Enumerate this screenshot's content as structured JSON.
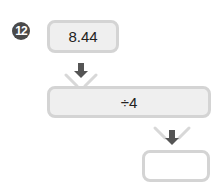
{
  "problem": {
    "number": "12",
    "input_value": "8.44",
    "operation": "÷4",
    "output_value": ""
  },
  "colors": {
    "badge": "#4a4a4a",
    "box_border": "#d4d4d4",
    "box_fill": "#efefef",
    "arrow": "#555555"
  }
}
